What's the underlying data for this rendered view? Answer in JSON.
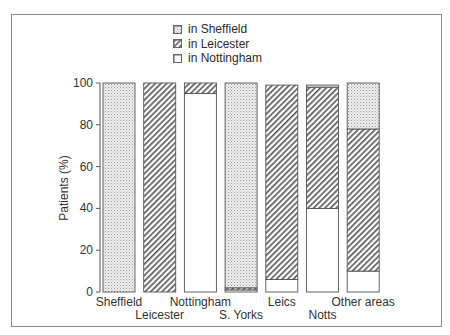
{
  "chart_data": {
    "type": "bar",
    "stacked": true,
    "title": "",
    "xlabel": "",
    "ylabel": "Patients (%)",
    "ylim": [
      0,
      100
    ],
    "yticks": [
      0,
      20,
      40,
      60,
      80,
      100
    ],
    "grid": false,
    "legend_position": "top",
    "categories": [
      "Sheffield",
      "Leicester",
      "Nottingham",
      "S. Yorks",
      "Leics",
      "Notts",
      "Other areas"
    ],
    "series": [
      {
        "name": "in Nottingham",
        "pattern": "white",
        "values": [
          0,
          0,
          95,
          1,
          6,
          40,
          10
        ]
      },
      {
        "name": "in Leicester",
        "pattern": "hatched",
        "values": [
          0,
          100,
          5,
          1,
          93,
          58,
          68
        ]
      },
      {
        "name": "in Sheffield",
        "pattern": "stippled",
        "values": [
          100,
          0,
          0,
          98,
          0,
          1,
          22
        ]
      }
    ]
  },
  "legend": {
    "items": [
      {
        "label": "in Sheffield",
        "pattern": "stippled"
      },
      {
        "label": "in Leicester",
        "pattern": "hatched"
      },
      {
        "label": "in Nottingham",
        "pattern": "white"
      }
    ]
  },
  "axis": {
    "y_title": "Patients (%)",
    "y_ticks": [
      "0",
      "20",
      "40",
      "60",
      "80",
      "100"
    ]
  },
  "categories": {
    "labels": [
      "Sheffield",
      "Leicester",
      "Nottingham",
      "S. Yorks",
      "Leics",
      "Notts",
      "Other areas"
    ]
  },
  "colors": {
    "line": "#555555",
    "stipple_bg": "#eeeeee",
    "stipple_dot": "#9a9a9a",
    "hatch": "#555555"
  }
}
